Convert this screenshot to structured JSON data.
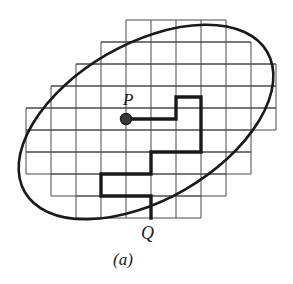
{
  "figure": {
    "caption": "(a)",
    "labels": {
      "point_p": "P",
      "point_q": "Q"
    },
    "colors": {
      "ink": "#1a1a1a",
      "grid": "#4a4a4a",
      "background": "#ffffff"
    },
    "geometry": {
      "canvas": {
        "width": 293,
        "height": 284
      },
      "grid": {
        "cell_width": 25,
        "cell_height": 22,
        "origin_x": 26,
        "origin_y": 20,
        "columns": 10,
        "rows": 9,
        "line_width": 1,
        "row_extents": [
          {
            "row": 0,
            "col_start": 4,
            "col_end": 8
          },
          {
            "row": 1,
            "col_start": 3,
            "col_end": 9
          },
          {
            "row": 2,
            "col_start": 2,
            "col_end": 10
          },
          {
            "row": 3,
            "col_start": 1,
            "col_end": 10
          },
          {
            "row": 4,
            "col_start": 0,
            "col_end": 10
          },
          {
            "row": 5,
            "col_start": 0,
            "col_end": 9
          },
          {
            "row": 6,
            "col_start": 0,
            "col_end": 9
          },
          {
            "row": 7,
            "col_start": 1,
            "col_end": 8
          },
          {
            "row": 8,
            "col_start": 2,
            "col_end": 7
          }
        ]
      },
      "ellipse": {
        "center_x": 146,
        "center_y": 122,
        "semi_major": 140,
        "semi_minor": 78,
        "rotation_deg": -30,
        "line_width": 2.6
      },
      "point_p": {
        "x": 126,
        "y": 119,
        "dot_radius": 5.5
      },
      "point_q": {
        "x": 151,
        "y": 218
      },
      "path": {
        "line_width": 3.4,
        "points": [
          {
            "x": 126,
            "y": 119
          },
          {
            "x": 176,
            "y": 119
          },
          {
            "x": 176,
            "y": 97
          },
          {
            "x": 201,
            "y": 97
          },
          {
            "x": 201,
            "y": 119
          },
          {
            "x": 201,
            "y": 152
          },
          {
            "x": 176,
            "y": 152
          },
          {
            "x": 151,
            "y": 152
          },
          {
            "x": 151,
            "y": 174
          },
          {
            "x": 126,
            "y": 174
          },
          {
            "x": 101,
            "y": 174
          },
          {
            "x": 101,
            "y": 196
          },
          {
            "x": 151,
            "y": 196
          },
          {
            "x": 151,
            "y": 218
          }
        ]
      },
      "label_positions": {
        "point_p": {
          "left": 123,
          "top": 91
        },
        "point_q": {
          "left": 141,
          "top": 224
        },
        "caption": {
          "left": 113,
          "top": 251
        }
      }
    }
  }
}
